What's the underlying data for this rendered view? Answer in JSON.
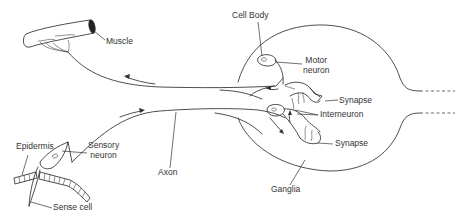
{
  "diagram": {
    "labels": {
      "muscle": "Muscle",
      "cell_body": "Cell Body",
      "motor_neuron": "Motor\nneuron",
      "motor_neuron_line1": "Motor",
      "motor_neuron_line2": "neuron",
      "synapse_top": "Synapse",
      "interneuron": "Interneuron",
      "synapse_bottom": "Synapse",
      "ganglia": "Ganglia",
      "axon": "Axon",
      "epidermis": "Epidermis",
      "sensory_neuron_line1": "Sensory",
      "sensory_neuron_line2": "neuron",
      "sense_cell": "Sense cell"
    },
    "colors": {
      "line": "#3a3a3a",
      "text": "#333333",
      "background": "#ffffff"
    },
    "flow_direction": [
      "sense cell",
      "sensory neuron",
      "axon",
      "interneuron (ganglia)",
      "motor neuron",
      "muscle"
    ]
  }
}
